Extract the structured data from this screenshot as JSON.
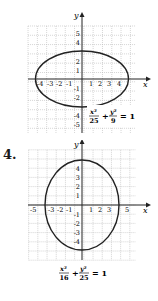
{
  "chart_data": [
    {
      "type": "line",
      "title": "",
      "equation": "x^2/25 + y^2/9 = 1",
      "equation_parts": {
        "x_num": "x²",
        "x_den": "25",
        "plus": "+",
        "y_num": "y²",
        "y_den": "9",
        "rhs": "= 1"
      },
      "xlabel": "x",
      "ylabel": "y",
      "xlim": [
        -6,
        6
      ],
      "ylim": [
        -6,
        6
      ],
      "grid": true,
      "x_tick_labels": [
        "-4",
        "-3",
        "-2",
        "-1",
        "1",
        "2",
        "3",
        "4"
      ],
      "y_tick_labels": [
        "5",
        "4",
        "2",
        "1",
        "-1",
        "-2",
        "-4",
        "-5"
      ],
      "series": [
        {
          "name": "ellipse",
          "shape": "ellipse",
          "center": [
            0,
            0
          ],
          "a": 5,
          "b": 3,
          "vertices": [
            [
              -5,
              0
            ],
            [
              5,
              0
            ],
            [
              0,
              3
            ],
            [
              0,
              -3
            ]
          ]
        }
      ]
    },
    {
      "type": "line",
      "title": "",
      "problem_number": "4.",
      "equation": "x^2/16 + y^2/25 = 1",
      "equation_parts": {
        "x_num": "x²",
        "x_den": "16",
        "plus": "+",
        "y_num": "y²",
        "y_den": "25",
        "rhs": "= 1"
      },
      "xlabel": "x",
      "ylabel": "y",
      "xlim": [
        -6,
        6
      ],
      "ylim": [
        -6,
        6
      ],
      "grid": true,
      "x_tick_labels": [
        "-5",
        "-3",
        "-2",
        "-1",
        "1",
        "2",
        "3",
        "5"
      ],
      "y_tick_labels": [
        "4",
        "3",
        "2",
        "1",
        "-1",
        "-2",
        "-3",
        "-4"
      ],
      "series": [
        {
          "name": "ellipse",
          "shape": "ellipse",
          "center": [
            0,
            0
          ],
          "a": 4,
          "b": 5,
          "vertices": [
            [
              -4,
              0
            ],
            [
              4,
              0
            ],
            [
              0,
              5
            ],
            [
              0,
              -5
            ]
          ]
        }
      ]
    }
  ],
  "figures": {
    "fig1": {
      "axis_x": "x",
      "axis_y": "y"
    },
    "fig2": {
      "problem_number": "4.",
      "axis_x": "x",
      "axis_y": "y"
    }
  }
}
